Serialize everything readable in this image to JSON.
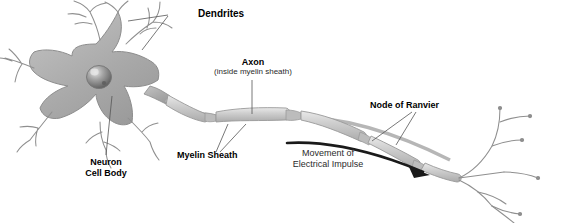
{
  "figure": {
    "background_color": "#ffffff"
  },
  "colors": {
    "soma_fill": "#a9a9a9",
    "soma_stroke": "#8d8d8d",
    "dendrite_stroke": "#8f8f8f",
    "nucleus_dark": "#6e6e6e",
    "nucleus_light": "#d8d8d8",
    "myelin_fill": "#cfcfcf",
    "myelin_stroke": "#9a9a9a",
    "axon_core": "#b6b6b6",
    "arrow_color": "#1a1a1a",
    "leader_line": "#555555",
    "label_text": "#000000"
  },
  "labels": {
    "dendrites": {
      "text": "Dendrites",
      "weight": "bold",
      "size_px": 10
    },
    "axon": {
      "text": "Axon",
      "weight": "bold",
      "size_px": 9
    },
    "axon_sub": {
      "text": "(inside myelin sheath)",
      "weight": "normal",
      "size_px": 8
    },
    "node_of_ranvier": {
      "text": "Node of Ranvier",
      "weight": "bold",
      "size_px": 9
    },
    "myelin_sheath": {
      "text": "Myelin Sheath",
      "weight": "bold",
      "size_px": 9
    },
    "neuron_cell_body_line1": {
      "text": "Neuron",
      "weight": "bold",
      "size_px": 9
    },
    "neuron_cell_body_line2": {
      "text": "Cell Body",
      "weight": "bold",
      "size_px": 9
    },
    "movement_line1": {
      "text": "Movement of",
      "weight": "normal",
      "size_px": 9
    },
    "movement_line2": {
      "text": "Electrical Impulse",
      "weight": "normal",
      "size_px": 9
    }
  },
  "parts": {
    "soma": "neuron-cell-body",
    "nucleus": "nucleus",
    "dendrites_count": 6,
    "myelin_segments": 5,
    "nodes_of_ranvier": 4,
    "axon_terminals": 9
  }
}
